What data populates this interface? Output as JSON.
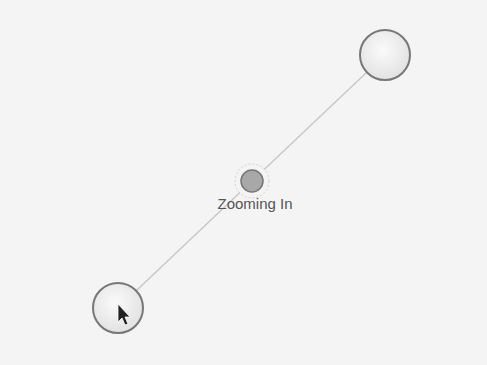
{
  "gesture": {
    "label": "Zooming In",
    "touch_points": [
      {
        "name": "touch-point-upper-right",
        "cx": 385,
        "cy": 55,
        "r": 25
      },
      {
        "name": "touch-point-lower-left",
        "cx": 118,
        "cy": 308,
        "r": 25
      }
    ],
    "center_point": {
      "cx": 252,
      "cy": 181,
      "r": 11
    },
    "colors": {
      "background": "#f4f4f4",
      "circle_fill": "#eeeeee",
      "circle_stroke": "#777777",
      "center_fill": "#aaaaaa",
      "line": "#bbbbbb",
      "text": "#555555"
    }
  },
  "cursor": {
    "icon": "arrow-pointer-icon",
    "x": 118,
    "y": 306
  }
}
